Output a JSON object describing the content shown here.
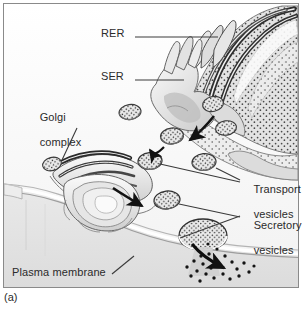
{
  "figure": {
    "caption": "(a)",
    "background_color": "#fdfdfd",
    "frame_color": "#8a8a8a",
    "text_color": "#2b2b2b"
  },
  "labels": {
    "rer": "RER",
    "ser": "SER",
    "golgi_line1": "Golgi",
    "golgi_line2": "complex",
    "transport_line1": "Transport",
    "transport_line2": "vesicles",
    "secretory_line1": "Secretory",
    "secretory_line2": "vesicles",
    "plasma_membrane": "Plasma membrane"
  },
  "structures": {
    "rer_name": "rough-endoplasmic-reticulum",
    "ser_name": "smooth-endoplasmic-reticulum",
    "golgi_name": "golgi-complex",
    "plasma_membrane_name": "plasma-membrane",
    "transport_vesicle_name": "transport-vesicle",
    "secretory_vesicle_name": "secretory-vesicle",
    "secreted_molecules_name": "secreted-molecules"
  },
  "colors": {
    "ink": "#1d1d1d",
    "membrane_dark": "#4d4d4d",
    "membrane_mid": "#9a9a9a",
    "membrane_light": "#d8d8d8",
    "fill_pale": "#efefef",
    "fill_gray": "#d2d2d2",
    "cytosol": "#f7f7f7",
    "outside": "#e4e4e4",
    "leader": "#3a3a3a"
  }
}
